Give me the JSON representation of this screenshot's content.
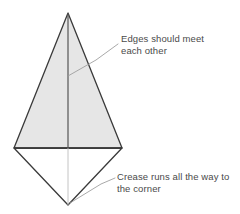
{
  "diagram": {
    "background_color": "#ffffff",
    "outline_color": "#3a3a3a",
    "shaded_fill_color": "#e6e6e6",
    "unshaded_fill_color": "#ffffff",
    "crease_line_color": "#555555",
    "thin_crease_color": "#b8b8b8",
    "leader_line_color": "#9a9a9a",
    "text_color": "#4a4a4a"
  },
  "annotations": [
    {
      "id": "edges-meet",
      "text": "Edges should meet\neach other",
      "line1": "Edges should meet",
      "line2": "each other"
    },
    {
      "id": "crease-corner",
      "text": "Crease runs all the way to\nthe corner",
      "line1": "Crease runs all the way to",
      "line2": "the corner"
    }
  ],
  "geometry": {
    "apex": {
      "x": 68,
      "y": 13
    },
    "left_vertex": {
      "x": 14,
      "y": 148
    },
    "right_vertex": {
      "x": 122,
      "y": 148
    },
    "bottom_vertex": {
      "x": 68,
      "y": 205
    },
    "shaded_triangle_points": "68,13 14,148 122,148",
    "lower_triangle_points": "14,148 122,148 68,205",
    "center_crease_upper": {
      "x1": 68,
      "y1": 13,
      "x2": 68,
      "y2": 148
    },
    "center_crease_lower": {
      "x1": 68,
      "y1": 148,
      "x2": 68,
      "y2": 205
    },
    "leader_edges_meet": "68,76 96,60 118,44",
    "leader_crease_corner": "70,203 100,184 115,178"
  }
}
